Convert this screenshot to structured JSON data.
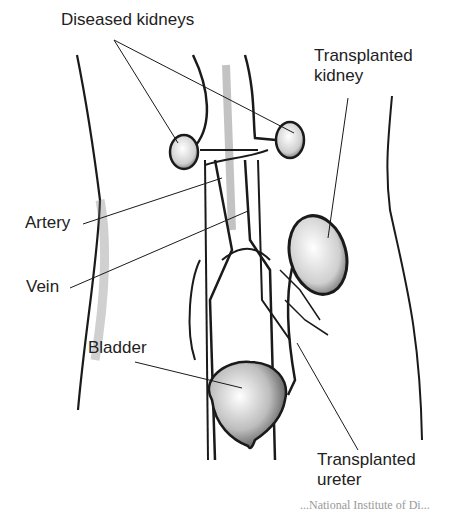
{
  "figure": {
    "type": "anatomical-illustration",
    "labels": {
      "diseased_kidneys": "Diseased kidneys",
      "transplanted_kidney_line1": "Transplanted",
      "transplanted_kidney_line2": "kidney",
      "artery": "Artery",
      "vein": "Vein",
      "bladder": "Bladder",
      "transplanted_ureter_line1": "Transplanted",
      "transplanted_ureter_line2": "ureter"
    },
    "credit_partial": "...National Institute of Di..."
  },
  "colors": {
    "ink": "#1a1a1a",
    "shade": "#8a8a8a",
    "background": "#ffffff"
  }
}
